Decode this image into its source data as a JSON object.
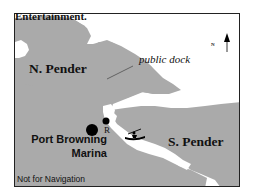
{
  "caption": {
    "text": "Entertainment."
  },
  "map": {
    "colors": {
      "land": "#aaaaaa",
      "water": "#ffffff",
      "border": "#222222",
      "text": "#111111"
    },
    "islands": [
      {
        "name": "N. Pender"
      },
      {
        "name": "S. Pender"
      }
    ],
    "markers": {
      "marina": {
        "line1": "Port Browning",
        "line2": "Marina",
        "icon": "large-dot"
      },
      "restaurant": {
        "label": "R",
        "icon": "small-dot"
      },
      "dock": {
        "label": "public dock",
        "icon": "leader-line"
      },
      "kayak": {
        "icon": "kayak-icon"
      }
    },
    "north_arrow": {
      "label": "N"
    },
    "disclaimer": "Not for Navigation"
  }
}
